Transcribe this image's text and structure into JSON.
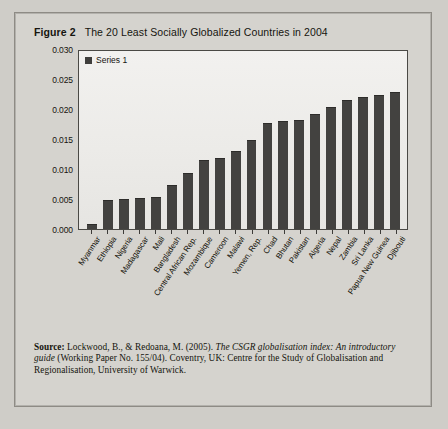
{
  "caption": {
    "figure_number": "Figure 2",
    "text": "The 20 Least Socially Globalized Countries in 2004"
  },
  "legend": {
    "series_label": "Series 1",
    "swatch_color": "#403f3d"
  },
  "source": {
    "label": "Source:",
    "line1_plain": " Lockwood, B., & Redoana, M. (2005). ",
    "line1_italic": "The CSGR globalisation index:",
    "line2_italic": "An introductory guide ",
    "line2_plain": "(Working Paper No. 155/04). Coventry, UK: Centre for the",
    "line3_plain": "Study of Globalisation and Regionalisation, University of Warwick."
  },
  "chart_data": {
    "type": "bar",
    "title": "The 20 Least Socially Globalized Countries in 2004",
    "xlabel": "",
    "ylabel": "",
    "ylim": [
      0.0,
      0.03
    ],
    "grid": false,
    "legend_position": "top-left",
    "bar_color": "#434240",
    "yticks": [
      "0.000",
      "0.005",
      "0.010",
      "0.015",
      "0.020",
      "0.025",
      "0.030"
    ],
    "ytick_values": [
      0.0,
      0.005,
      0.01,
      0.015,
      0.02,
      0.025,
      0.03
    ],
    "categories": [
      "Myanmar",
      "Ethiopia",
      "Nigeria",
      "Madagascar",
      "Mali",
      "Bangladesh",
      "Central African Rep.",
      "Mozambique",
      "Cameroon",
      "Malawi",
      "Yemen, Rep.",
      "Chad",
      "Bhutan",
      "Pakistan",
      "Algeria",
      "Nepal",
      "Zambia",
      "Sri Lanka",
      "Papua New Guinea",
      "Djibouti"
    ],
    "series": [
      {
        "name": "Series 1",
        "values": [
          0.0008,
          0.0049,
          0.005,
          0.0052,
          0.0053,
          0.0073,
          0.0093,
          0.0115,
          0.0118,
          0.013,
          0.0148,
          0.0176,
          0.018,
          0.0182,
          0.0191,
          0.0204,
          0.0215,
          0.022,
          0.0224,
          0.0228
        ]
      }
    ]
  }
}
